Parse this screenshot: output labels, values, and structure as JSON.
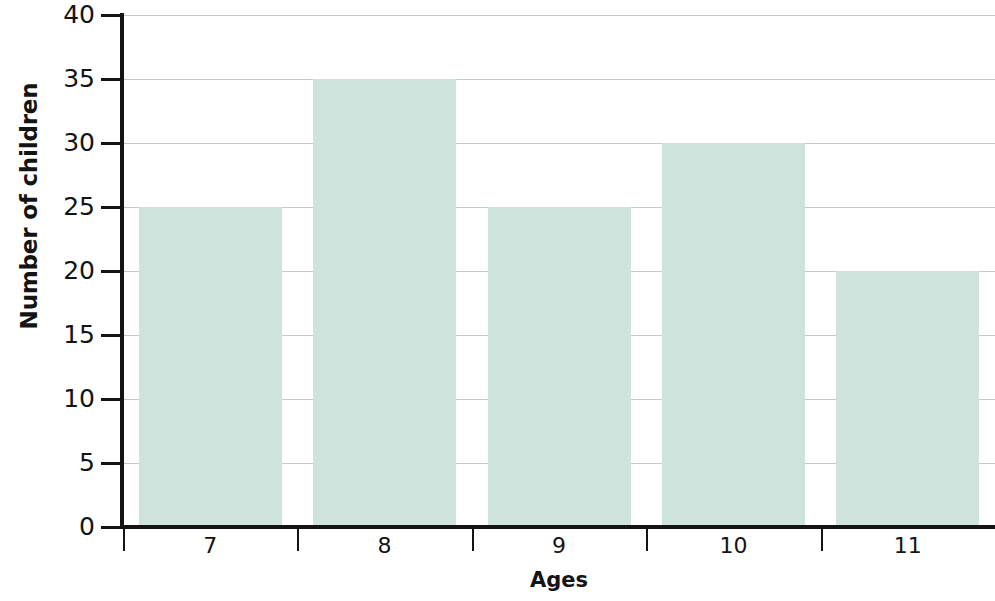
{
  "chart_data": {
    "type": "bar",
    "title": "",
    "xlabel": "Ages",
    "ylabel": "Number of children",
    "categories": [
      "7",
      "8",
      "9",
      "10",
      "11"
    ],
    "values": [
      25,
      35,
      25,
      30,
      20
    ],
    "ylim": [
      0,
      40
    ],
    "ytick_labels": [
      "0",
      "5",
      "10",
      "15",
      "20",
      "25",
      "30",
      "35",
      "40"
    ],
    "ytick_values": [
      0,
      5,
      10,
      15,
      20,
      25,
      30,
      35,
      40
    ],
    "grid": true,
    "legend": "none",
    "bar_color": "#cfe3dd",
    "axis_color": "#141414",
    "gridline_color": "#c8c9cb",
    "background_color": "#ffffff"
  }
}
